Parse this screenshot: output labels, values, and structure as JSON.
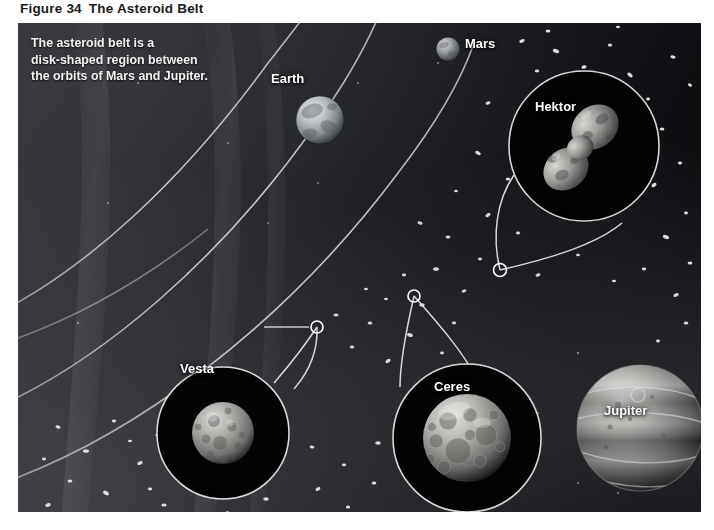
{
  "figure": {
    "number": "Figure 34",
    "title": "The Asteroid Belt"
  },
  "caption": {
    "text": "The asteroid belt is a\ndisk-shaped region between\nthe orbits of Mars and Jupiter."
  },
  "bodies": [
    {
      "key": "earth",
      "label": "Earth"
    },
    {
      "key": "mars",
      "label": "Mars"
    },
    {
      "key": "hektor",
      "label": "Hektor"
    },
    {
      "key": "vesta",
      "label": "Vesta"
    },
    {
      "key": "ceres",
      "label": "Ceres"
    },
    {
      "key": "jupiter",
      "label": "Jupiter"
    }
  ],
  "colors": {
    "title_text": "#1b1b1b",
    "page_background": "#ffffff",
    "space_dark": "#08080a",
    "space_light": "#3a3b40",
    "orbit_line": "#c9c9c9",
    "callout_ring": "#d8d8d8",
    "label_text": "#ffffff",
    "asteroid_speck": "#e8e8e8"
  }
}
